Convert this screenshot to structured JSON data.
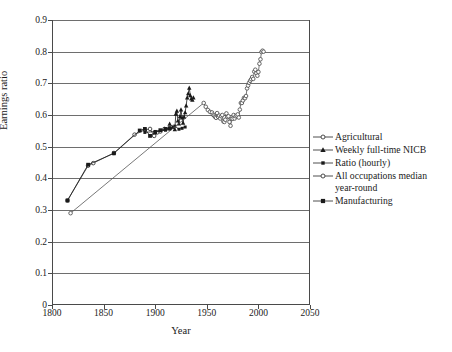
{
  "chart_data": {
    "type": "line",
    "title": "",
    "xlabel": "Year",
    "ylabel": "Earnings ratio",
    "xlim": [
      1800,
      2050
    ],
    "ylim": [
      0,
      0.9
    ],
    "xticks": [
      "1800",
      "1850",
      "1900",
      "1950",
      "2000",
      "2050"
    ],
    "xtick_values": [
      1800,
      1850,
      1900,
      1950,
      2000,
      2050
    ],
    "yticks": [
      "0",
      "0.1",
      "0.2",
      "0.3",
      "0.4",
      "0.5",
      "0.6",
      "0.7",
      "0.8",
      "0.9"
    ],
    "ytick_values": [
      0,
      0.1,
      0.2,
      0.3,
      0.4,
      0.5,
      0.6,
      0.7,
      0.8,
      0.9
    ],
    "grid": "horizontal",
    "legend_position": "right",
    "series": [
      {
        "name": "Agricultural",
        "marker": "open-circle-cross",
        "color": "#3a3a3a",
        "points": [
          [
            1815,
            0.33
          ],
          [
            1835,
            0.44
          ],
          [
            1840,
            0.448
          ],
          [
            1860,
            0.48
          ],
          [
            1880,
            0.538
          ],
          [
            1890,
            0.553
          ],
          [
            1895,
            0.556
          ],
          [
            1899,
            0.534
          ],
          [
            1902,
            0.545
          ],
          [
            1905,
            0.548
          ],
          [
            1909,
            0.556
          ],
          [
            1914,
            0.558
          ]
        ]
      },
      {
        "name": "Weekly full-time NICB",
        "marker": "filled-triangle",
        "color": "#1a1a1a",
        "points": [
          [
            1914,
            0.572
          ],
          [
            1917,
            0.562
          ],
          [
            1919,
            0.555
          ],
          [
            1920,
            0.604
          ],
          [
            1921,
            0.613
          ],
          [
            1922,
            0.582
          ],
          [
            1923,
            0.573
          ],
          [
            1924,
            0.596
          ],
          [
            1925,
            0.617
          ],
          [
            1926,
            0.592
          ],
          [
            1927,
            0.575
          ],
          [
            1928,
            0.594
          ],
          [
            1929,
            0.608
          ],
          [
            1930,
            0.63
          ],
          [
            1931,
            0.655
          ],
          [
            1932,
            0.668
          ],
          [
            1933,
            0.686
          ],
          [
            1934,
            0.662
          ],
          [
            1935,
            0.652
          ],
          [
            1936,
            0.648
          ],
          [
            1937,
            0.655
          ]
        ]
      },
      {
        "name": "Ratio (hourly)",
        "marker": "filled-square-small",
        "color": "#1a1a1a",
        "points": [
          [
            1890,
            0.545
          ],
          [
            1900,
            0.548
          ],
          [
            1910,
            0.552
          ],
          [
            1914,
            0.556
          ],
          [
            1919,
            0.565
          ],
          [
            1923,
            0.555
          ],
          [
            1926,
            0.558
          ],
          [
            1929,
            0.562
          ]
        ]
      },
      {
        "name": "All occupations median\nyear-round",
        "marker": "open-circle",
        "color": "#555555",
        "points": [
          [
            1818,
            0.29
          ],
          [
            1947,
            0.638
          ],
          [
            1949,
            0.626
          ],
          [
            1951,
            0.616
          ],
          [
            1953,
            0.61
          ],
          [
            1955,
            0.608
          ],
          [
            1956,
            0.601
          ],
          [
            1957,
            0.598
          ],
          [
            1958,
            0.594
          ],
          [
            1959,
            0.591
          ],
          [
            1960,
            0.606
          ],
          [
            1961,
            0.594
          ],
          [
            1962,
            0.598
          ],
          [
            1963,
            0.589
          ],
          [
            1964,
            0.596
          ],
          [
            1965,
            0.6
          ],
          [
            1966,
            0.58
          ],
          [
            1967,
            0.578
          ],
          [
            1968,
            0.585
          ],
          [
            1969,
            0.605
          ],
          [
            1970,
            0.594
          ],
          [
            1971,
            0.596
          ],
          [
            1972,
            0.578
          ],
          [
            1973,
            0.566
          ],
          [
            1974,
            0.588
          ],
          [
            1975,
            0.588
          ],
          [
            1976,
            0.6
          ],
          [
            1977,
            0.589
          ],
          [
            1978,
            0.596
          ],
          [
            1979,
            0.598
          ],
          [
            1980,
            0.602
          ],
          [
            1981,
            0.592
          ],
          [
            1982,
            0.617
          ],
          [
            1983,
            0.638
          ],
          [
            1984,
            0.638
          ],
          [
            1985,
            0.646
          ],
          [
            1986,
            0.654
          ],
          [
            1987,
            0.653
          ],
          [
            1988,
            0.66
          ],
          [
            1989,
            0.684
          ],
          [
            1990,
            0.693
          ],
          [
            1991,
            0.702
          ],
          [
            1992,
            0.708
          ],
          [
            1993,
            0.713
          ],
          [
            1994,
            0.72
          ],
          [
            1995,
            0.714
          ],
          [
            1996,
            0.737
          ],
          [
            1997,
            0.743
          ],
          [
            1998,
            0.732
          ],
          [
            1999,
            0.724
          ],
          [
            2000,
            0.736
          ],
          [
            2001,
            0.762
          ],
          [
            2002,
            0.776
          ],
          [
            2003,
            0.799
          ],
          [
            2004,
            0.803
          ],
          [
            2005,
            0.8
          ]
        ]
      },
      {
        "name": "Manufacturing",
        "marker": "filled-square",
        "color": "#1a1a1a",
        "points": [
          [
            1815,
            0.33
          ],
          [
            1835,
            0.443
          ],
          [
            1860,
            0.479
          ],
          [
            1885,
            0.551
          ],
          [
            1890,
            0.556
          ],
          [
            1895,
            0.534
          ],
          [
            1900,
            0.545
          ],
          [
            1905,
            0.552
          ],
          [
            1910,
            0.556
          ],
          [
            1914,
            0.558
          ]
        ]
      }
    ]
  },
  "legend": {
    "items": [
      {
        "label": "Agricultural",
        "marker": "open-circle-cross"
      },
      {
        "label": "Weekly full-time NICB",
        "marker": "filled-triangle"
      },
      {
        "label": "Ratio (hourly)",
        "marker": "filled-square-small"
      },
      {
        "label": "All occupations median\nyear-round",
        "marker": "open-circle"
      },
      {
        "label": "Manufacturing",
        "marker": "filled-square"
      }
    ]
  }
}
